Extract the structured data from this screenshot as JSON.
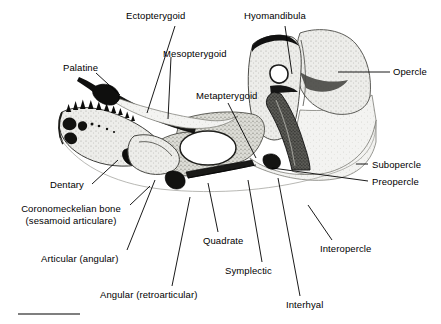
{
  "figure": {
    "background_color": "#ffffff",
    "ink_color": "#000000",
    "bone_fill_light": "#e9e9e6",
    "bone_fill_mid": "#cfcfc9",
    "bone_fill_dark": "#3a3a3a"
  },
  "labels": [
    {
      "id": "ectopterygoid",
      "text": "Ectopterygoid"
    },
    {
      "id": "mesopterygoid",
      "text": "Mesopterygoid"
    },
    {
      "id": "hyomandibula",
      "text": "Hyomandibula"
    },
    {
      "id": "opercle",
      "text": "Opercle"
    },
    {
      "id": "palatine",
      "text": "Palatine"
    },
    {
      "id": "metapterygoid",
      "text": "Metapterygoid"
    },
    {
      "id": "subopercle",
      "text": "Subopercle"
    },
    {
      "id": "preopercle",
      "text": "Preopercle"
    },
    {
      "id": "dentary",
      "text": "Dentary"
    },
    {
      "id": "coronomeckelian",
      "text": "Coronomeckelian bone"
    },
    {
      "id": "coronomeckelian_sub",
      "text": "(sesamoid articulare)"
    },
    {
      "id": "articular",
      "text": "Articular (angular)"
    },
    {
      "id": "quadrate",
      "text": "Quadrate"
    },
    {
      "id": "symplectic",
      "text": "Symplectic"
    },
    {
      "id": "interhyal",
      "text": "Interhyal"
    },
    {
      "id": "interopercle",
      "text": "Interopercle"
    },
    {
      "id": "angular",
      "text": "Angular (retroarticular)"
    }
  ],
  "scale_bar": {
    "present": true,
    "caption": ""
  }
}
